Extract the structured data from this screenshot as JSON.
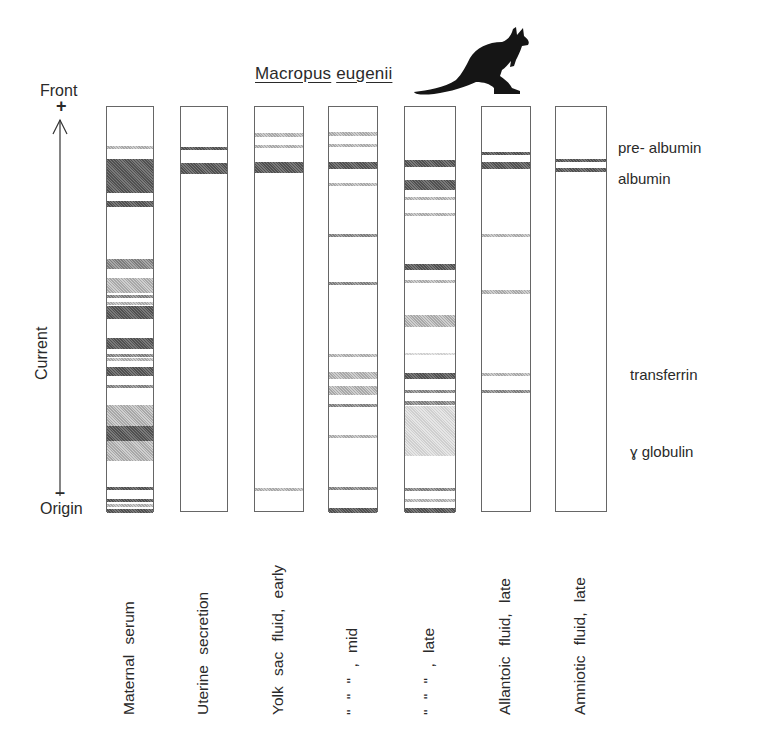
{
  "title": {
    "genus": "Macropus",
    "species": "eugenii"
  },
  "icon": "kangaroo-silhouette",
  "axis": {
    "top_label": "Front",
    "top_sign": "+",
    "bottom_label": "Origin",
    "bottom_sign": "–",
    "axis_label": "Current"
  },
  "protein_labels": {
    "pre_albumin": "pre- albumin",
    "albumin": "albumin",
    "transferrin": "transferrin",
    "gamma_globulin": "ɣ globulin"
  },
  "lanes": [
    {
      "label": "Maternal serum",
      "x": 106,
      "w": 48,
      "bands": [
        [
          145,
          3,
          "light"
        ],
        [
          158,
          34,
          "dark"
        ],
        [
          200,
          6,
          "dark"
        ],
        [
          258,
          10,
          "mid"
        ],
        [
          277,
          15,
          "light"
        ],
        [
          294,
          3,
          "mid"
        ],
        [
          301,
          3,
          "light"
        ],
        [
          305,
          13,
          "dark"
        ],
        [
          337,
          11,
          "dark"
        ],
        [
          353,
          3,
          "mid"
        ],
        [
          357,
          3,
          "light"
        ],
        [
          366,
          9,
          "dark"
        ],
        [
          384,
          3,
          "mid"
        ],
        [
          404,
          21,
          "light"
        ],
        [
          425,
          15,
          "dark"
        ],
        [
          440,
          20,
          "light"
        ],
        [
          486,
          3,
          "dark"
        ],
        [
          498,
          3,
          "dark"
        ],
        [
          503,
          3,
          "light"
        ],
        [
          508,
          4,
          "dark"
        ]
      ]
    },
    {
      "label": "Uterine secretion",
      "x": 180,
      "w": 48,
      "bands": [
        [
          146,
          3,
          "dark"
        ],
        [
          162,
          11,
          "dark"
        ]
      ]
    },
    {
      "label": "Yolk sac  fluid, early",
      "x": 254,
      "w": 50,
      "bands": [
        [
          132,
          4,
          "light"
        ],
        [
          144,
          3,
          "light"
        ],
        [
          161,
          11,
          "dark"
        ],
        [
          487,
          3,
          "light"
        ]
      ]
    },
    {
      "label": "\"      \"      \" , mid",
      "x": 328,
      "w": 50,
      "bands": [
        [
          131,
          4,
          "light"
        ],
        [
          143,
          3,
          "light"
        ],
        [
          161,
          7,
          "dark"
        ],
        [
          182,
          3,
          "light"
        ],
        [
          233,
          3,
          "mid"
        ],
        [
          281,
          3,
          "mid"
        ],
        [
          353,
          3,
          "light"
        ],
        [
          371,
          7,
          "light"
        ],
        [
          385,
          9,
          "light"
        ],
        [
          403,
          3,
          "mid"
        ],
        [
          434,
          3,
          "light"
        ],
        [
          486,
          3,
          "mid"
        ],
        [
          507,
          5,
          "dark"
        ]
      ]
    },
    {
      "label": "\"      \"      \" , late",
      "x": 404,
      "w": 52,
      "bands": [
        [
          159,
          7,
          "dark"
        ],
        [
          179,
          10,
          "dark"
        ],
        [
          196,
          3,
          "light"
        ],
        [
          212,
          3,
          "light"
        ],
        [
          263,
          6,
          "dark"
        ],
        [
          279,
          3,
          "light"
        ],
        [
          314,
          12,
          "light"
        ],
        [
          352,
          2,
          "faint"
        ],
        [
          372,
          6,
          "dark"
        ],
        [
          389,
          3,
          "mid"
        ],
        [
          400,
          4,
          "mid"
        ],
        [
          405,
          50,
          "faint"
        ],
        [
          487,
          3,
          "mid"
        ],
        [
          498,
          3,
          "light"
        ],
        [
          507,
          5,
          "dark"
        ]
      ]
    },
    {
      "label": "Allantoic  fluid, late",
      "x": 481,
      "w": 50,
      "bands": [
        [
          151,
          3,
          "dark"
        ],
        [
          161,
          7,
          "dark"
        ],
        [
          233,
          3,
          "light"
        ],
        [
          289,
          4,
          "light"
        ],
        [
          372,
          3,
          "light"
        ],
        [
          389,
          3,
          "mid"
        ]
      ]
    },
    {
      "label": "Amniotic  fluid, late",
      "x": 555,
      "w": 52,
      "bands": [
        [
          158,
          3,
          "dark"
        ],
        [
          167,
          4,
          "dark"
        ]
      ]
    }
  ]
}
